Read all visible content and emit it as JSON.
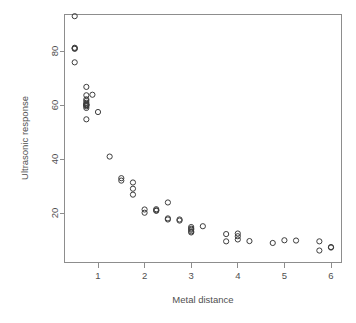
{
  "chart_data": {
    "type": "scatter",
    "title": "",
    "xlabel": "Metal distance",
    "ylabel": "Ultrasonic response",
    "xlim": [
      0.38,
      6.32
    ],
    "ylim": [
      1.8,
      94.5
    ],
    "xticks": [
      1,
      2,
      3,
      4,
      5,
      6
    ],
    "yticks": [
      20,
      40,
      60,
      80
    ],
    "xtick_labels": [
      "1",
      "2",
      "3",
      "4",
      "5",
      "6"
    ],
    "ytick_labels": [
      "20",
      "40",
      "60",
      "80"
    ],
    "grid": false,
    "legend": "none",
    "marker": "open-circle",
    "marker_color": "#3d3d3d",
    "point_count": 54,
    "x": [
      0.5,
      0.5,
      0.5,
      0.5,
      0.5,
      0.75,
      0.75,
      0.75,
      0.75,
      0.75,
      0.75,
      0.75,
      0.75,
      0.75,
      0.75,
      0.75,
      1.0,
      1.25,
      1.5,
      1.5,
      1.75,
      1.75,
      1.75,
      2.0,
      2.0,
      2.25,
      2.25,
      2.25,
      2.5,
      2.5,
      2.75,
      2.75,
      3.0,
      3.0,
      3.0,
      3.0,
      3.25,
      3.75,
      3.75,
      4.0,
      4.0,
      4.0,
      4.25,
      4.75,
      5.0,
      5.25,
      5.75,
      5.75,
      6.0,
      6.0,
      0.5,
      0.75,
      2.25,
      3.0
    ],
    "y": [
      92.9,
      81.0,
      81.0,
      80.8,
      75.8,
      66.7,
      63.6,
      62.1,
      61.5,
      60.8,
      60.3,
      60.0,
      59.9,
      59.5,
      58.9,
      54.7,
      57.4,
      40.9,
      32.9,
      32.0,
      31.3,
      29.0,
      26.8,
      21.3,
      20.1,
      21.4,
      21.0,
      20.6,
      23.9,
      17.6,
      17.5,
      17.4,
      14.6,
      14.0,
      13.4,
      12.9,
      15.1,
      12.2,
      9.5,
      12.4,
      11.4,
      10.2,
      9.6,
      8.9,
      9.9,
      9.8,
      9.5,
      6.1,
      7.4,
      7.2,
      81.2,
      60.1,
      20.8,
      13.8
    ],
    "points": [
      {
        "x": 0.5,
        "y": 92.9
      },
      {
        "x": 0.5,
        "y": 81.2
      },
      {
        "x": 0.5,
        "y": 81.0
      },
      {
        "x": 0.5,
        "y": 80.8
      },
      {
        "x": 0.5,
        "y": 75.8
      },
      {
        "x": 0.75,
        "y": 66.7
      },
      {
        "x": 0.75,
        "y": 63.6
      },
      {
        "x": 0.75,
        "y": 62.1
      },
      {
        "x": 0.75,
        "y": 61.5
      },
      {
        "x": 0.75,
        "y": 60.8
      },
      {
        "x": 0.75,
        "y": 60.3
      },
      {
        "x": 0.75,
        "y": 60.1
      },
      {
        "x": 0.75,
        "y": 60.0
      },
      {
        "x": 0.75,
        "y": 59.9
      },
      {
        "x": 0.75,
        "y": 59.5
      },
      {
        "x": 0.75,
        "y": 58.9
      },
      {
        "x": 0.75,
        "y": 54.7
      },
      {
        "x": 0.88,
        "y": 63.8
      },
      {
        "x": 1.0,
        "y": 57.4
      },
      {
        "x": 1.25,
        "y": 40.9
      },
      {
        "x": 1.5,
        "y": 32.9
      },
      {
        "x": 1.5,
        "y": 32.0
      },
      {
        "x": 1.75,
        "y": 31.3
      },
      {
        "x": 1.75,
        "y": 29.0
      },
      {
        "x": 1.75,
        "y": 26.8
      },
      {
        "x": 2.0,
        "y": 21.3
      },
      {
        "x": 2.0,
        "y": 20.1
      },
      {
        "x": 2.25,
        "y": 21.4
      },
      {
        "x": 2.25,
        "y": 21.0
      },
      {
        "x": 2.25,
        "y": 20.8
      },
      {
        "x": 2.5,
        "y": 23.9
      },
      {
        "x": 2.5,
        "y": 18.0
      },
      {
        "x": 2.5,
        "y": 17.6
      },
      {
        "x": 2.75,
        "y": 17.6
      },
      {
        "x": 2.75,
        "y": 17.2
      },
      {
        "x": 3.0,
        "y": 14.8
      },
      {
        "x": 3.0,
        "y": 14.2
      },
      {
        "x": 3.0,
        "y": 13.8
      },
      {
        "x": 3.0,
        "y": 13.2
      },
      {
        "x": 3.0,
        "y": 12.8
      },
      {
        "x": 3.25,
        "y": 15.1
      },
      {
        "x": 3.75,
        "y": 12.2
      },
      {
        "x": 3.75,
        "y": 9.5
      },
      {
        "x": 4.0,
        "y": 12.4
      },
      {
        "x": 4.0,
        "y": 11.4
      },
      {
        "x": 4.0,
        "y": 10.2
      },
      {
        "x": 4.25,
        "y": 9.6
      },
      {
        "x": 4.75,
        "y": 8.9
      },
      {
        "x": 5.0,
        "y": 9.9
      },
      {
        "x": 5.25,
        "y": 9.8
      },
      {
        "x": 5.75,
        "y": 9.5
      },
      {
        "x": 5.75,
        "y": 6.1
      },
      {
        "x": 6.0,
        "y": 7.4
      },
      {
        "x": 6.0,
        "y": 7.2
      }
    ]
  },
  "axes": {
    "x_title": "Metal distance",
    "y_title": "Ultrasonic response"
  }
}
